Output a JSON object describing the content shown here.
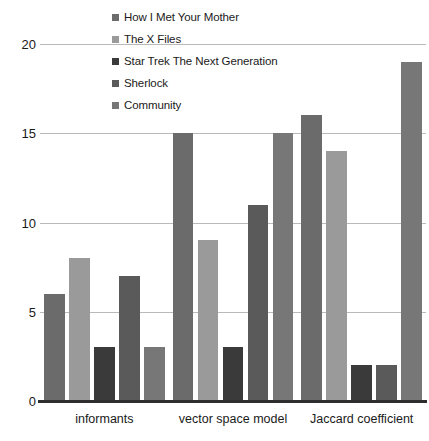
{
  "chart_data": {
    "type": "bar",
    "title": "",
    "xlabel": "",
    "ylabel": "",
    "ylim": [
      0,
      21.5
    ],
    "yticks": [
      0,
      5,
      10,
      15,
      20
    ],
    "ytick_labels": [
      "0",
      "5",
      "10",
      "15",
      "20"
    ],
    "grid": true,
    "legend_position": "top-center",
    "categories": [
      "informants",
      "vector space model",
      "Jaccard coefficient"
    ],
    "series": [
      {
        "name": "How I Met Your Mother",
        "color": "#6b6b6b",
        "values": [
          6,
          15,
          16
        ]
      },
      {
        "name": "The X Files",
        "color": "#9a9a9a",
        "values": [
          8,
          9,
          14
        ]
      },
      {
        "name": "Star Trek The Next Generation",
        "color": "#3a3a3a",
        "values": [
          3,
          3,
          2
        ]
      },
      {
        "name": "Sherlock",
        "color": "#5a5a5a",
        "values": [
          7,
          11,
          2
        ]
      },
      {
        "name": "Community",
        "color": "#777777",
        "values": [
          3,
          15,
          19
        ]
      }
    ]
  },
  "axis": {
    "gridline_color": "#b9b9b9",
    "baseline_color": "#2e2e2e"
  }
}
